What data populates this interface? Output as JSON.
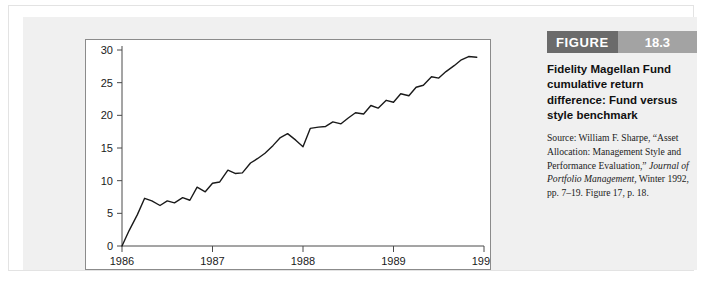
{
  "figure": {
    "badge_word": "FIGURE",
    "badge_number": "18.3",
    "title": "Fidelity Magellan Fund cumulative return difference: Fund versus style benchmark",
    "source_prefix": "Source: William F. Sharpe, “Asset Allocation: Management Style and Performance Evaluation,” ",
    "source_italic": "Journal of Portfolio Management,",
    "source_suffix": " Winter 1992, pp. 7–19. Figure 17, p. 18."
  },
  "chart_data": {
    "type": "line",
    "title": "Fidelity Magellan Fund cumulative return difference: Fund versus style benchmark",
    "xlabel": "",
    "ylabel": "",
    "xlim": [
      1986,
      1990
    ],
    "ylim": [
      0,
      30
    ],
    "grid": false,
    "legend": "none",
    "line_color": "#1a1a1a",
    "xticks": [
      "1986",
      "1987",
      "1988",
      "1989",
      "1990"
    ],
    "xtick_values": [
      1986,
      1987,
      1988,
      1989,
      1990
    ],
    "yticks": [
      "0",
      "5",
      "10",
      "15",
      "20",
      "25",
      "30"
    ],
    "ytick_values": [
      0,
      5,
      10,
      15,
      20,
      25,
      30
    ],
    "series": [
      {
        "name": "Cumulative return difference",
        "x": [
          1986.0,
          1986.08,
          1986.17,
          1986.25,
          1986.33,
          1986.42,
          1986.5,
          1986.58,
          1986.67,
          1986.75,
          1986.83,
          1986.92,
          1987.0,
          1987.08,
          1987.17,
          1987.25,
          1987.33,
          1987.42,
          1987.5,
          1987.58,
          1987.67,
          1987.75,
          1987.83,
          1987.92,
          1988.0,
          1988.08,
          1988.17,
          1988.25,
          1988.33,
          1988.42,
          1988.5,
          1988.58,
          1988.67,
          1988.75,
          1988.83,
          1988.92,
          1989.0,
          1989.08,
          1989.17,
          1989.25,
          1989.33,
          1989.42,
          1989.5,
          1989.58,
          1989.67,
          1989.75,
          1989.83,
          1989.92
        ],
        "y": [
          0.0,
          2.4,
          4.8,
          7.3,
          6.9,
          6.2,
          6.9,
          6.6,
          7.4,
          7.0,
          9.0,
          8.3,
          9.6,
          9.8,
          11.6,
          11.1,
          11.2,
          12.7,
          13.4,
          14.2,
          15.4,
          16.6,
          17.2,
          16.2,
          15.2,
          18.0,
          18.2,
          18.3,
          19.0,
          18.7,
          19.6,
          20.4,
          20.2,
          21.5,
          21.1,
          22.3,
          22.0,
          23.3,
          23.0,
          24.3,
          24.6,
          25.9,
          25.7,
          26.7,
          27.6,
          28.5,
          29.0,
          28.9
        ]
      }
    ]
  }
}
